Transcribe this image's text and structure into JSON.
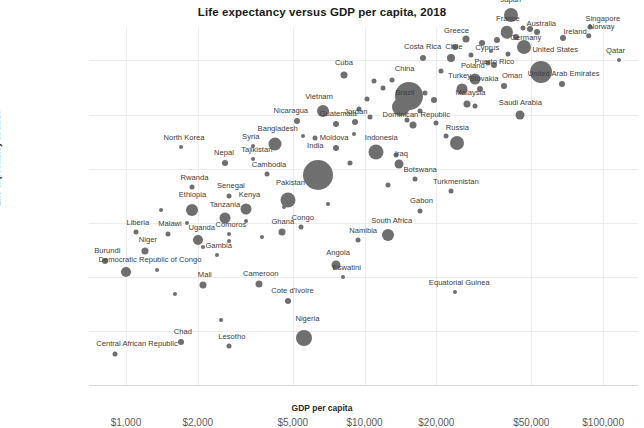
{
  "chart_data": {
    "type": "scatter",
    "title": "Life expectancy versus GDP per capita, 2018",
    "xlabel": "GDP per capita",
    "ylabel": "Life expectancy at birth",
    "xscale": "log",
    "xlim": [
      700,
      140000
    ],
    "ylim": [
      50,
      83
    ],
    "grid": true,
    "legend": "none",
    "xticks": [
      "$1,000",
      "$2,000",
      "$5,000",
      "$10,000",
      "$20,000",
      "$50,000",
      "$100,000"
    ],
    "xtick_values": [
      1000,
      2000,
      5000,
      10000,
      20000,
      50000,
      100000
    ],
    "yticks": [
      "50 years",
      "55 years",
      "60 years",
      "65 years",
      "70 years",
      "75 years",
      "80 years"
    ],
    "ytick_values": [
      50,
      55,
      60,
      65,
      70,
      75,
      80
    ],
    "size_encodes": "population",
    "points": [
      {
        "name": "Japan",
        "x": 41000,
        "y": 84.2,
        "r": 7.0,
        "lx": 0,
        "ly": -4
      },
      {
        "name": "Australia",
        "x": 49500,
        "y": 82.9,
        "r": 3.0,
        "lx": 11,
        "ly": 2
      },
      {
        "name": "Singapore",
        "x": 88000,
        "y": 83.1,
        "r": 2.5,
        "lx": 13,
        "ly": -1
      },
      {
        "name": "France",
        "x": 39500,
        "y": 82.6,
        "r": 6.2,
        "lx": 1,
        "ly": -3
      },
      {
        "name": "Ireland",
        "x": 68000,
        "y": 82.1,
        "r": 3.0,
        "lx": 12,
        "ly": 1
      },
      {
        "name": "Norway",
        "x": 87000,
        "y": 82.3,
        "r": 2.8,
        "lx": 13,
        "ly": -2
      },
      {
        "name": "Germany",
        "x": 46500,
        "y": 81.2,
        "r": 7.0,
        "lx": 2,
        "ly": 2
      },
      {
        "name": "Greece",
        "x": 26500,
        "y": 82.0,
        "r": 3.5,
        "lx": -9,
        "ly": 0
      },
      {
        "name": "Cyprus",
        "x": 34000,
        "y": 80.9,
        "r": 2.0,
        "lx": -4,
        "ly": 3
      },
      {
        "name": "Costa Rica",
        "x": 17500,
        "y": 80.2,
        "r": 3.0,
        "lx": 0,
        "ly": -4
      },
      {
        "name": "Chile",
        "x": 23000,
        "y": 80.2,
        "r": 4.0,
        "lx": 3,
        "ly": -3
      },
      {
        "name": "Puerto Rico",
        "x": 35000,
        "y": 79.6,
        "r": 3.0,
        "lx": 0,
        "ly": 4
      },
      {
        "name": "United States",
        "x": 55000,
        "y": 78.9,
        "r": 11.0,
        "lx": 14,
        "ly": -7
      },
      {
        "name": "Qatar",
        "x": 116000,
        "y": 80.0,
        "r": 2.0,
        "lx": -3,
        "ly": -3
      },
      {
        "name": "United Arab Emirates",
        "x": 67000,
        "y": 77.8,
        "r": 3.0,
        "lx": 2,
        "ly": -3
      },
      {
        "name": "Poland",
        "x": 29000,
        "y": 78.3,
        "r": 5.5,
        "lx": -2,
        "ly": -3
      },
      {
        "name": "Slovakia",
        "x": 30500,
        "y": 77.4,
        "r": 3.0,
        "lx": 4,
        "ly": -3
      },
      {
        "name": "Oman",
        "x": 38500,
        "y": 77.6,
        "r": 3.0,
        "lx": 8,
        "ly": -3
      },
      {
        "name": "Turkey",
        "x": 25500,
        "y": 77.4,
        "r": 5.5,
        "lx": -2,
        "ly": -3
      },
      {
        "name": "Cuba",
        "x": 8200,
        "y": 78.7,
        "r": 3.5,
        "lx": 0,
        "ly": -4
      },
      {
        "name": "China",
        "x": 15300,
        "y": 76.7,
        "r": 14.0,
        "lx": -4,
        "ly": -9
      },
      {
        "name": "Brazil",
        "x": 14200,
        "y": 75.7,
        "r": 9.0,
        "lx": 4,
        "ly": -1
      },
      {
        "name": "Malaysia",
        "x": 27000,
        "y": 76.0,
        "r": 3.5,
        "lx": 3,
        "ly": -3
      },
      {
        "name": "Saudi Arabia",
        "x": 45000,
        "y": 75.0,
        "r": 4.5,
        "lx": 0,
        "ly": -3
      },
      {
        "name": "Dominican Republic",
        "x": 16000,
        "y": 74.0,
        "r": 3.5,
        "lx": 3,
        "ly": -3
      },
      {
        "name": "Jordan",
        "x": 9100,
        "y": 74.3,
        "r": 3.0,
        "lx": 1,
        "ly": -3
      },
      {
        "name": "Vietnam",
        "x": 6700,
        "y": 75.3,
        "r": 6.0,
        "lx": -4,
        "ly": -4
      },
      {
        "name": "Nicaragua",
        "x": 5200,
        "y": 74.4,
        "r": 3.0,
        "lx": -6,
        "ly": -3
      },
      {
        "name": "Guatemala",
        "x": 7600,
        "y": 74.1,
        "r": 3.0,
        "lx": 2,
        "ly": -3
      },
      {
        "name": "Russia",
        "x": 24500,
        "y": 72.4,
        "r": 7.0,
        "lx": 0,
        "ly": -4
      },
      {
        "name": "Indonesia",
        "x": 11200,
        "y": 71.5,
        "r": 7.5,
        "lx": 5,
        "ly": -3
      },
      {
        "name": "Iraq",
        "x": 14000,
        "y": 70.4,
        "r": 4.5,
        "lx": 2,
        "ly": -2
      },
      {
        "name": "Moldova",
        "x": 7600,
        "y": 71.9,
        "r": 3.0,
        "lx": -2,
        "ly": -3
      },
      {
        "name": "Bangladesh",
        "x": 4200,
        "y": 72.3,
        "r": 6.5,
        "lx": 3,
        "ly": -4
      },
      {
        "name": "Syria",
        "x": 3400,
        "y": 72.1,
        "r": 2.0,
        "lx": -2,
        "ly": -3
      },
      {
        "name": "Tajikistan",
        "x": 3400,
        "y": 70.9,
        "r": 2.0,
        "lx": 4,
        "ly": -3
      },
      {
        "name": "North Korea",
        "x": 1700,
        "y": 72.0,
        "r": 2.0,
        "lx": 3,
        "ly": -3
      },
      {
        "name": "Nepal",
        "x": 2600,
        "y": 70.5,
        "r": 3.0,
        "lx": -1,
        "ly": -3
      },
      {
        "name": "Cambodia",
        "x": 3900,
        "y": 69.5,
        "r": 2.5,
        "lx": 2,
        "ly": -3
      },
      {
        "name": "India",
        "x": 6400,
        "y": 69.4,
        "r": 15.0,
        "lx": -3,
        "ly": -10
      },
      {
        "name": "Botswana",
        "x": 16300,
        "y": 69.0,
        "r": 2.5,
        "lx": 5,
        "ly": -3
      },
      {
        "name": "Turkmenistan",
        "x": 23000,
        "y": 67.9,
        "r": 2.5,
        "lx": 5,
        "ly": -3
      },
      {
        "name": "Pakistan",
        "x": 4800,
        "y": 67.1,
        "r": 7.5,
        "lx": 2,
        "ly": -6
      },
      {
        "name": "Gabon",
        "x": 17000,
        "y": 66.1,
        "r": 2.5,
        "lx": 2,
        "ly": -3
      },
      {
        "name": "Rwanda",
        "x": 1900,
        "y": 68.3,
        "r": 2.5,
        "lx": 2,
        "ly": -3
      },
      {
        "name": "Senegal",
        "x": 2700,
        "y": 67.5,
        "r": 2.5,
        "lx": 2,
        "ly": -3
      },
      {
        "name": "Ethiopia",
        "x": 1900,
        "y": 66.2,
        "r": 6.0,
        "lx": 0,
        "ly": -5
      },
      {
        "name": "Kenya",
        "x": 3200,
        "y": 66.3,
        "r": 5.5,
        "lx": 3,
        "ly": -4
      },
      {
        "name": "Tanzania",
        "x": 2600,
        "y": 65.4,
        "r": 5.5,
        "lx": 0,
        "ly": -4
      },
      {
        "name": "South Africa",
        "x": 12500,
        "y": 63.9,
        "r": 6.0,
        "lx": 4,
        "ly": -4
      },
      {
        "name": "Namibia",
        "x": 9400,
        "y": 63.4,
        "r": 2.5,
        "lx": 5,
        "ly": -3
      },
      {
        "name": "Ghana",
        "x": 4500,
        "y": 64.1,
        "r": 3.5,
        "lx": 1,
        "ly": -3
      },
      {
        "name": "Congo",
        "x": 5400,
        "y": 64.6,
        "r": 2.5,
        "lx": 2,
        "ly": -3
      },
      {
        "name": "Uganda",
        "x": 2000,
        "y": 63.4,
        "r": 5.0,
        "lx": 4,
        "ly": -3
      },
      {
        "name": "Comoros",
        "x": 2700,
        "y": 64.0,
        "r": 2.0,
        "lx": 2,
        "ly": -3
      },
      {
        "name": "Malawi",
        "x": 1500,
        "y": 64.0,
        "r": 2.5,
        "lx": 2,
        "ly": -3
      },
      {
        "name": "Liberia",
        "x": 1100,
        "y": 64.1,
        "r": 2.5,
        "lx": 2,
        "ly": -3
      },
      {
        "name": "Gambia",
        "x": 2400,
        "y": 62.0,
        "r": 2.0,
        "lx": 2,
        "ly": -3
      },
      {
        "name": "Niger",
        "x": 1200,
        "y": 62.4,
        "r": 3.5,
        "lx": 3,
        "ly": -3
      },
      {
        "name": "Burundi",
        "x": 820,
        "y": 61.5,
        "r": 3.0,
        "lx": 2,
        "ly": -3
      },
      {
        "name": "Democratic Republic of Congo",
        "x": 1000,
        "y": 60.4,
        "r": 5.0,
        "lx": 24,
        "ly": -3
      },
      {
        "name": "Angola",
        "x": 7600,
        "y": 61.1,
        "r": 4.5,
        "lx": 2,
        "ly": -3
      },
      {
        "name": "Eswatini",
        "x": 8100,
        "y": 60.0,
        "r": 2.0,
        "lx": 4,
        "ly": -3
      },
      {
        "name": "Equatorial Guinea",
        "x": 24000,
        "y": 58.6,
        "r": 2.0,
        "lx": 4,
        "ly": -3
      },
      {
        "name": "Mali",
        "x": 2100,
        "y": 59.2,
        "r": 3.5,
        "lx": 2,
        "ly": -3
      },
      {
        "name": "Cameroon",
        "x": 3600,
        "y": 59.3,
        "r": 3.5,
        "lx": 2,
        "ly": -3
      },
      {
        "name": "Cote d'Ivoire",
        "x": 4800,
        "y": 57.8,
        "r": 3.0,
        "lx": 4,
        "ly": -3
      },
      {
        "name": "Nigeria",
        "x": 5600,
        "y": 54.3,
        "r": 8.0,
        "lx": 3,
        "ly": -7
      },
      {
        "name": "Chad",
        "x": 1700,
        "y": 54.0,
        "r": 3.0,
        "lx": 2,
        "ly": -3
      },
      {
        "name": "Lesotho",
        "x": 2700,
        "y": 53.6,
        "r": 2.5,
        "lx": 3,
        "ly": -3
      },
      {
        "name": "Central African Republic",
        "x": 900,
        "y": 52.9,
        "r": 2.5,
        "lx": 22,
        "ly": -3
      }
    ],
    "unlabeled_points": [
      {
        "x": 1400,
        "y": 66.2,
        "r": 2.0
      },
      {
        "x": 1800,
        "y": 65.0,
        "r": 2.0
      },
      {
        "x": 2700,
        "y": 63.3,
        "r": 2.0
      },
      {
        "x": 3700,
        "y": 63.7,
        "r": 2.0
      },
      {
        "x": 2100,
        "y": 62.8,
        "r": 2.0
      },
      {
        "x": 1350,
        "y": 60.6,
        "r": 2.0
      },
      {
        "x": 1600,
        "y": 58.4,
        "r": 2.0
      },
      {
        "x": 2500,
        "y": 56.0,
        "r": 2.0
      },
      {
        "x": 3200,
        "y": 65.2,
        "r": 2.0
      },
      {
        "x": 4600,
        "y": 66.5,
        "r": 2.0
      },
      {
        "x": 6200,
        "y": 72.8,
        "r": 2.5
      },
      {
        "x": 5500,
        "y": 73.0,
        "r": 2.0
      },
      {
        "x": 9000,
        "y": 73.2,
        "r": 2.0
      },
      {
        "x": 10200,
        "y": 76.4,
        "r": 2.5
      },
      {
        "x": 9500,
        "y": 75.5,
        "r": 2.5
      },
      {
        "x": 12000,
        "y": 77.5,
        "r": 2.5
      },
      {
        "x": 13000,
        "y": 78.2,
        "r": 2.5
      },
      {
        "x": 11000,
        "y": 78.1,
        "r": 2.5
      },
      {
        "x": 18000,
        "y": 77.0,
        "r": 2.5
      },
      {
        "x": 19500,
        "y": 76.3,
        "r": 3.0
      },
      {
        "x": 17000,
        "y": 75.3,
        "r": 2.5
      },
      {
        "x": 15000,
        "y": 74.5,
        "r": 2.5
      },
      {
        "x": 20000,
        "y": 74.2,
        "r": 2.5
      },
      {
        "x": 21000,
        "y": 79.0,
        "r": 2.5
      },
      {
        "x": 28000,
        "y": 80.5,
        "r": 2.5
      },
      {
        "x": 31000,
        "y": 81.6,
        "r": 3.0
      },
      {
        "x": 24000,
        "y": 81.2,
        "r": 3.0
      },
      {
        "x": 36000,
        "y": 81.9,
        "r": 3.0
      },
      {
        "x": 43000,
        "y": 82.2,
        "r": 3.0
      },
      {
        "x": 53000,
        "y": 82.6,
        "r": 3.0
      },
      {
        "x": 33000,
        "y": 79.8,
        "r": 2.5
      },
      {
        "x": 40000,
        "y": 80.6,
        "r": 2.5
      },
      {
        "x": 46000,
        "y": 83.0,
        "r": 2.5
      },
      {
        "x": 29000,
        "y": 75.8,
        "r": 2.5
      },
      {
        "x": 22000,
        "y": 73.0,
        "r": 2.5
      },
      {
        "x": 13500,
        "y": 71.3,
        "r": 2.5
      },
      {
        "x": 8700,
        "y": 70.5,
        "r": 2.5
      },
      {
        "x": 12500,
        "y": 68.5,
        "r": 2.5
      },
      {
        "x": 7000,
        "y": 66.7,
        "r": 2.0
      },
      {
        "x": 6000,
        "y": 70.0,
        "r": 2.0
      },
      {
        "x": 10500,
        "y": 74.8,
        "r": 2.5
      }
    ]
  }
}
